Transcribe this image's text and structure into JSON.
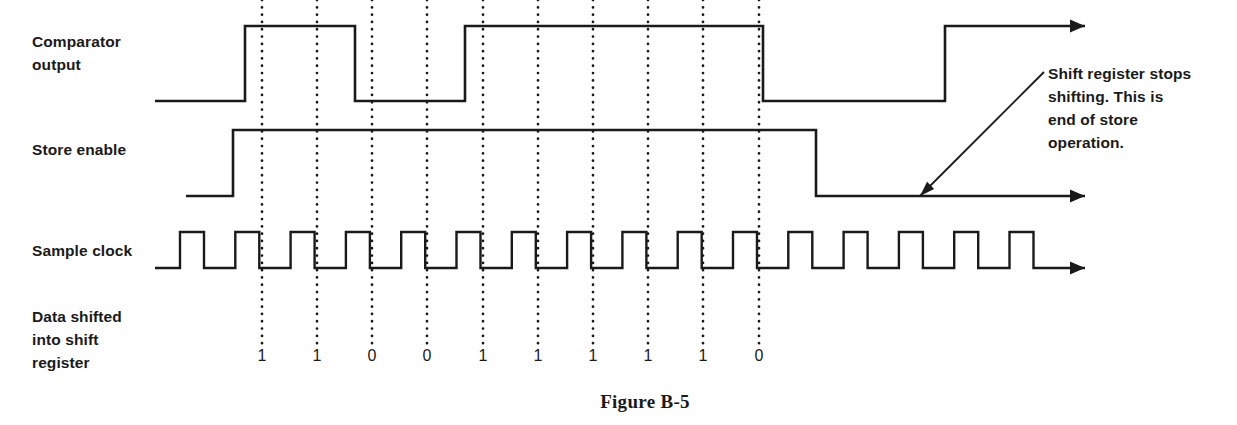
{
  "figure": {
    "caption": "Figure B-5",
    "caption_x": 645,
    "caption_y": 408
  },
  "labels": {
    "comparator_line1": "Comparator",
    "comparator_line2": "output",
    "store_enable": "Store enable",
    "sample_clock": "Sample clock",
    "data_line1": "Data shifted",
    "data_line2": "into shift",
    "data_line3": "register"
  },
  "annotation": {
    "line1": "Shift register stops",
    "line2": "shifting.  This is",
    "line3": "end of store",
    "line4": "operation."
  },
  "chart_data": {
    "type": "line",
    "title": "Figure B-5",
    "xlabel": "",
    "ylabel": "",
    "geometry": {
      "x_start": 155,
      "x_end": 1085,
      "dot_x": [
        262,
        317,
        372,
        427,
        483,
        538,
        593,
        648,
        703,
        759
      ],
      "clock_period": 55.3,
      "clock_first_rise": 180,
      "clock_pulse_width": 24
    },
    "series": [
      {
        "name": "Comparator output",
        "row": 1,
        "y_high": 26,
        "y_low": 101,
        "x_from": 155,
        "x_to": 1085,
        "transitions": [
          {
            "x": 245,
            "to": "high"
          },
          {
            "x": 355,
            "to": "low"
          },
          {
            "x": 465,
            "to": "high"
          },
          {
            "x": 763,
            "to": "low"
          },
          {
            "x": 945,
            "to": "high"
          }
        ],
        "initial": "low",
        "arrow_end": true
      },
      {
        "name": "Store enable",
        "row": 2,
        "y_high": 130,
        "y_low": 196,
        "x_from": 186,
        "x_to": 1085,
        "transitions": [
          {
            "x": 233,
            "to": "high"
          },
          {
            "x": 816,
            "to": "low"
          }
        ],
        "initial": "low",
        "arrow_end": true
      },
      {
        "name": "Sample clock",
        "row": 3,
        "y_high": 232,
        "y_low": 268,
        "x_from": 155,
        "x_to": 1085,
        "pulse_count": 16,
        "arrow_end": true
      }
    ],
    "bits": {
      "label": "Data shifted into shift register",
      "y": 361,
      "values": [
        "1",
        "1",
        "0",
        "0",
        "1",
        "1",
        "1",
        "1",
        "1",
        "0"
      ],
      "x": [
        262,
        317,
        372,
        427,
        483,
        538,
        593,
        648,
        703,
        759
      ]
    },
    "dotted_guides": [
      {
        "x": 262,
        "y1": 0,
        "y2": 345
      },
      {
        "x": 317,
        "y1": 0,
        "y2": 345
      },
      {
        "x": 372,
        "y1": 0,
        "y2": 345
      },
      {
        "x": 427,
        "y1": 0,
        "y2": 345
      },
      {
        "x": 483,
        "y1": 0,
        "y2": 345
      },
      {
        "x": 538,
        "y1": 0,
        "y2": 345
      },
      {
        "x": 593,
        "y1": 0,
        "y2": 345
      },
      {
        "x": 648,
        "y1": 0,
        "y2": 345
      },
      {
        "x": 703,
        "y1": 0,
        "y2": 345
      },
      {
        "x": 759,
        "y1": 0,
        "y2": 345
      }
    ],
    "leader": {
      "from_x": 1044,
      "from_y": 72,
      "to_x": 920,
      "to_y": 196
    }
  }
}
